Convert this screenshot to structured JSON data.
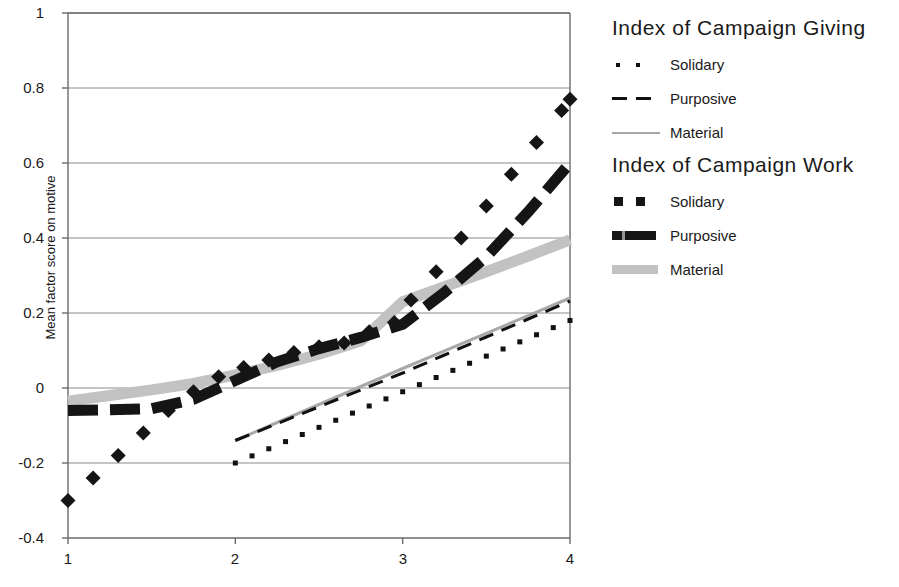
{
  "figure": {
    "ylabel": "Mean factor score on motive",
    "background": "#ffffff",
    "axis_color": "#6b6b6b",
    "grid_color": "#8a8a8a"
  },
  "axes": {
    "y_ticks": [
      "1",
      "0.8",
      "0.6",
      "0.4",
      "0.2",
      "0",
      "-0.2",
      "-0.4"
    ],
    "x_ticks": [
      "1",
      "2",
      "3",
      "4"
    ]
  },
  "legend": {
    "groups": [
      {
        "title": "Index of Campaign Giving",
        "entries": [
          {
            "label": "Solidary",
            "swatch": "thin-dotted-marker",
            "color": "#111111"
          },
          {
            "label": "Purposive",
            "swatch": "thin-dashed-line",
            "color": "#111111"
          },
          {
            "label": "Material",
            "swatch": "thin-solid-line",
            "color": "#a8a8a8"
          }
        ]
      },
      {
        "title": "Index of Campaign Work",
        "entries": [
          {
            "label": "Solidary",
            "swatch": "thick-square-marker",
            "color": "#151515"
          },
          {
            "label": "Purposive",
            "swatch": "thick-dashed-line",
            "color": "#151515"
          },
          {
            "label": "Material",
            "swatch": "thick-solid-line",
            "color": "#c2c2c2"
          }
        ]
      }
    ]
  },
  "chart_data": {
    "type": "line",
    "title": "",
    "xlabel": "",
    "ylabel": "Mean factor score on motive",
    "xlim": [
      1,
      4
    ],
    "ylim": [
      -0.4,
      1
    ],
    "y_ticks": [
      -0.4,
      -0.2,
      0,
      0.2,
      0.4,
      0.6,
      0.8,
      1
    ],
    "x_ticks": [
      1,
      2,
      3,
      4
    ],
    "grid": "horizontal",
    "legend_position": "right",
    "series": [
      {
        "name": "Index of Campaign Giving - Solidary",
        "group": "Index of Campaign Giving",
        "motive": "Solidary",
        "style": "thin-dotted",
        "color": "#111111",
        "x": [
          2.0,
          2.1,
          2.2,
          2.3,
          2.4,
          2.5,
          2.6,
          2.7,
          2.8,
          2.9,
          3.0,
          3.1,
          3.2,
          3.3,
          3.4,
          3.5,
          3.6,
          3.7,
          3.8,
          3.9,
          4.0
        ],
        "y": [
          -0.2,
          -0.181,
          -0.162,
          -0.143,
          -0.124,
          -0.105,
          -0.086,
          -0.067,
          -0.048,
          -0.029,
          -0.01,
          0.009,
          0.028,
          0.047,
          0.066,
          0.085,
          0.104,
          0.123,
          0.142,
          0.161,
          0.18
        ]
      },
      {
        "name": "Index of Campaign Giving - Purposive",
        "group": "Index of Campaign Giving",
        "motive": "Purposive",
        "style": "thin-dashed",
        "color": "#111111",
        "x": [
          2.0,
          2.25,
          2.5,
          2.75,
          3.0,
          3.25,
          3.5,
          3.75,
          4.0
        ],
        "y": [
          -0.14,
          -0.095,
          -0.05,
          -0.005,
          0.04,
          0.088,
          0.136,
          0.184,
          0.232
        ]
      },
      {
        "name": "Index of Campaign Giving - Material",
        "group": "Index of Campaign Giving",
        "motive": "Material",
        "style": "thin-solid",
        "color": "#a8a8a8",
        "x": [
          2.0,
          2.25,
          2.5,
          2.75,
          3.0,
          3.25,
          3.5,
          3.75,
          4.0
        ],
        "y": [
          -0.14,
          -0.092,
          -0.044,
          0.004,
          0.052,
          0.099,
          0.146,
          0.193,
          0.24
        ]
      },
      {
        "name": "Index of Campaign Work - Solidary",
        "group": "Index of Campaign Work",
        "motive": "Solidary",
        "style": "thick-square-marker",
        "color": "#151515",
        "x": [
          1.0,
          1.15,
          1.3,
          1.45,
          1.6,
          1.75,
          1.9,
          2.05,
          2.2,
          2.35,
          2.5,
          2.65,
          2.8,
          2.95,
          3.05,
          3.2,
          3.35,
          3.5,
          3.65,
          3.8,
          3.95,
          4.0
        ],
        "y": [
          -0.3,
          -0.24,
          -0.18,
          -0.12,
          -0.06,
          -0.01,
          0.03,
          0.055,
          0.075,
          0.095,
          0.11,
          0.12,
          0.15,
          0.175,
          0.235,
          0.31,
          0.4,
          0.485,
          0.57,
          0.655,
          0.74,
          0.77
        ]
      },
      {
        "name": "Index of Campaign Work - Purposive",
        "group": "Index of Campaign Work",
        "motive": "Purposive",
        "style": "thick-dashed",
        "color": "#151515",
        "x": [
          1.0,
          1.25,
          1.5,
          1.75,
          2.0,
          2.25,
          2.5,
          2.75,
          3.0,
          3.25,
          3.5,
          3.75,
          4.0
        ],
        "y": [
          -0.06,
          -0.058,
          -0.055,
          -0.03,
          0.02,
          0.07,
          0.105,
          0.135,
          0.17,
          0.255,
          0.35,
          0.47,
          0.6
        ]
      },
      {
        "name": "Index of Campaign Work - Material",
        "group": "Index of Campaign Work",
        "motive": "Material",
        "style": "thick-solid",
        "color": "#c2c2c2",
        "x": [
          1.0,
          1.25,
          1.5,
          1.75,
          2.0,
          2.25,
          2.5,
          2.75,
          3.0,
          3.25,
          3.5,
          3.75,
          4.0
        ],
        "y": [
          -0.035,
          -0.02,
          -0.005,
          0.012,
          0.035,
          0.06,
          0.09,
          0.125,
          0.23,
          0.27,
          0.31,
          0.352,
          0.395
        ]
      }
    ]
  }
}
